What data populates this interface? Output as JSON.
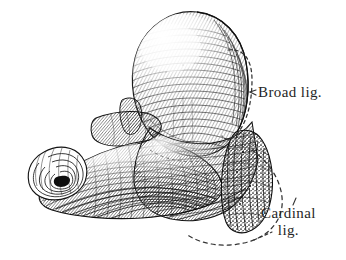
{
  "figure": {
    "domain": "anatomical-engraving",
    "technique": "line engraving / cross-hatching",
    "background_color": "#ffffff",
    "ink_color": "#1a1a1a",
    "dash_color": "#3a3a3a",
    "width": 346,
    "height": 260
  },
  "labels": {
    "broad": {
      "text": "Broad lig.",
      "x": 258,
      "y": 84
    },
    "cardinal": {
      "line1": "Cardinal",
      "line2": "lig.",
      "x": 261,
      "y": 205
    }
  },
  "annotations": {
    "broad_region": {
      "name": "broad-ligament-outline",
      "style": "dashed closed loop",
      "leader_tick": "arrow pointing left"
    },
    "cardinal_region": {
      "name": "cardinal-ligament-outline",
      "style": "dashed arc",
      "leader_tick": "dashes pointing upper-left"
    }
  },
  "structures": {
    "fundus": "uterine fundus",
    "body": "uterine body",
    "tube": "fallopian tube",
    "fimbriae": "fimbriated end",
    "round_lig_stump": "round ligament stump",
    "cut_edge": "cut tissue margin"
  }
}
